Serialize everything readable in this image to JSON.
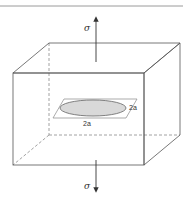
{
  "figure": {
    "colors": {
      "line": "#555555",
      "dashed": "#8a8a8a",
      "crack_fill": "#d9d9d9",
      "border": "#9a9a9a",
      "background": "#ffffff"
    },
    "labels": {
      "stress_top": "σ",
      "stress_bottom": "σ",
      "crack_width": "2a",
      "crack_depth": "2a"
    }
  }
}
